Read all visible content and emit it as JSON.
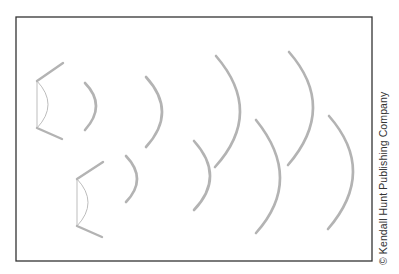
{
  "figure": {
    "frame": {
      "x": 16,
      "y": 17,
      "width": 356,
      "height": 244,
      "stroke": "#333333"
    },
    "wave_color": "#b3b3b3",
    "sources": [
      {
        "name": "source-upper",
        "apex_top": [
          37,
          81
        ],
        "apex_bottom": [
          37,
          128
        ],
        "arm_top_end": [
          63,
          63
        ],
        "arm_bottom_end": [
          62,
          139
        ],
        "inner_bulge_x": 48,
        "wavefronts": [
          {
            "top": [
              85,
              83
            ],
            "bottom": [
              85,
              130
            ],
            "bulge": [
              96,
              106
            ]
          },
          {
            "top": [
              146,
              77
            ],
            "bottom": [
              146,
              147
            ],
            "bulge": [
              162,
              112
            ]
          },
          {
            "top": [
              216,
              56
            ],
            "bottom": [
              215,
              167
            ],
            "bulge": [
              240,
              112
            ]
          },
          {
            "top": [
              289,
              52
            ],
            "bottom": [
              288,
              165
            ],
            "bulge": [
              313,
              108
            ]
          }
        ]
      },
      {
        "name": "source-lower",
        "apex_top": [
          77,
          179
        ],
        "apex_bottom": [
          77,
          226
        ],
        "arm_top_end": [
          103,
          162
        ],
        "arm_bottom_end": [
          102,
          237
        ],
        "inner_bulge_x": 88,
        "wavefronts": [
          {
            "top": [
              126,
              156
            ],
            "bottom": [
              126,
              202
            ],
            "bulge": [
              137,
              179
            ]
          },
          {
            "top": [
              194,
              141
            ],
            "bottom": [
              194,
              210
            ],
            "bulge": [
              210,
              176
            ]
          },
          {
            "top": [
              256,
              120
            ],
            "bottom": [
              256,
              233
            ],
            "bulge": [
              280,
              178
            ]
          },
          {
            "top": [
              329,
              116
            ],
            "bottom": [
              328,
              229
            ],
            "bulge": [
              353,
              172
            ]
          }
        ]
      }
    ]
  },
  "credit": "© Kendall Hunt Publishing Company"
}
